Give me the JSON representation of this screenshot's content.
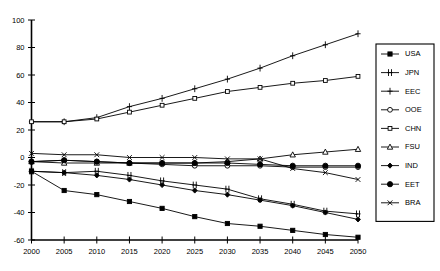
{
  "chart_data": {
    "type": "line",
    "title": "",
    "xlabel": "",
    "ylabel": "",
    "grid": false,
    "legend_position": "right",
    "x": [
      2000,
      2005,
      2010,
      2015,
      2020,
      2025,
      2030,
      2035,
      2040,
      2045,
      2050
    ],
    "xtick_labels": [
      "2000",
      "2005",
      "2010",
      "2015",
      "2020",
      "2025",
      "2030",
      "2035",
      "2040",
      "2045",
      "2050"
    ],
    "ytick_labels": [
      "100",
      "80",
      "60",
      "40",
      "20",
      "0",
      "-20",
      "-40",
      "-60"
    ],
    "ytick_values": [
      100,
      80,
      60,
      40,
      20,
      0,
      -20,
      -40,
      -60
    ],
    "xlim": [
      2000,
      2050
    ],
    "ylim": [
      -60,
      100
    ],
    "series": [
      {
        "name": "USA",
        "marker": "filled-square",
        "values": [
          -10,
          -24,
          -27,
          -32,
          -37,
          -43,
          -48,
          -50,
          -53,
          -56,
          -58
        ]
      },
      {
        "name": "JPN",
        "marker": "double-tick",
        "values": [
          -10,
          -11,
          -10,
          -13,
          -17,
          -20,
          -23,
          -30,
          -34,
          -39,
          -41
        ]
      },
      {
        "name": "EEC",
        "marker": "plus",
        "values": [
          26,
          26,
          29,
          37,
          43,
          50,
          57,
          65,
          74,
          82,
          90
        ]
      },
      {
        "name": "OOE",
        "marker": "open-circle",
        "values": [
          -3,
          -2,
          -3,
          -4,
          -5,
          -6,
          -6,
          -6,
          -7,
          -7,
          -7
        ]
      },
      {
        "name": "CHN",
        "marker": "small-open-square",
        "values": [
          26,
          26,
          28,
          33,
          38,
          43,
          48,
          51,
          54,
          56,
          59
        ]
      },
      {
        "name": "FSU",
        "marker": "open-triangle",
        "values": [
          -3,
          -4,
          -4,
          -4,
          -4,
          -4,
          -3,
          -1,
          2,
          4,
          6
        ]
      },
      {
        "name": "IND",
        "marker": "filled-diamond",
        "values": [
          -10,
          -11,
          -13,
          -16,
          -20,
          -24,
          -27,
          -31,
          -35,
          -40,
          -45
        ]
      },
      {
        "name": "EET",
        "marker": "large-filled-circle",
        "values": [
          -3,
          -2,
          -3,
          -4,
          -4,
          -4,
          -4,
          -5,
          -6,
          -6,
          -6
        ]
      },
      {
        "name": "BRA",
        "marker": "cross-x",
        "values": [
          3,
          2,
          2,
          0,
          0,
          0,
          -1,
          -1,
          -8,
          -11,
          -16
        ]
      }
    ]
  },
  "legend": {
    "entries": [
      "USA",
      "JPN",
      "EEC",
      "OOE",
      "CHN",
      "FSU",
      "IND",
      "EET",
      "BRA"
    ]
  }
}
